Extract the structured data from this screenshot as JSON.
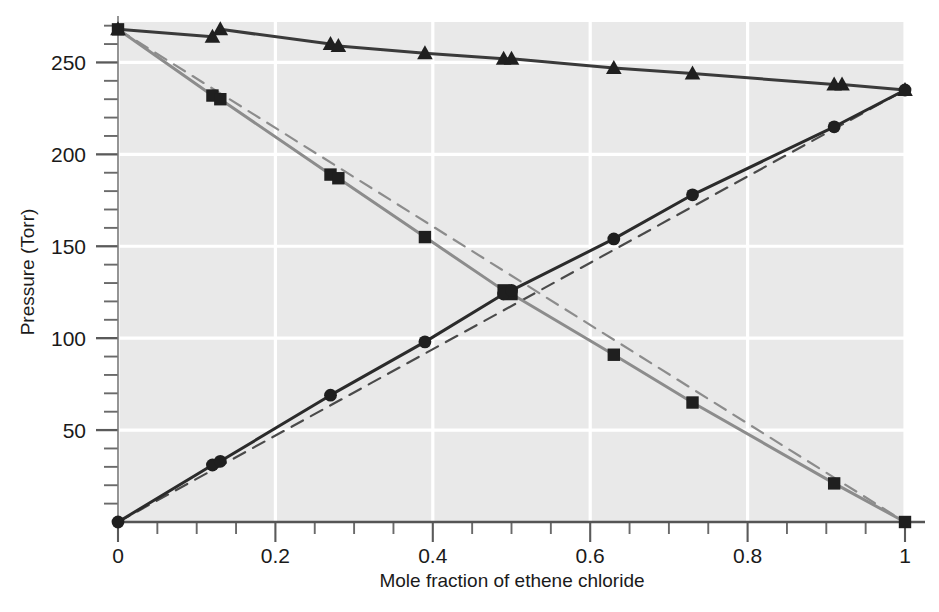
{
  "chart_data": {
    "type": "line",
    "title": "",
    "xlabel": "Mole fraction of ethene chloride",
    "ylabel": "Pressure (Torr)",
    "xlim": [
      0,
      1
    ],
    "ylim": [
      0,
      272
    ],
    "xticks": [
      "0",
      "0.2",
      "0.4",
      "0.6",
      "0.8",
      "1"
    ],
    "xtick_values": [
      0,
      0.2,
      0.4,
      0.6,
      0.8,
      1
    ],
    "yticks": [
      "50",
      "100",
      "150",
      "200",
      "250"
    ],
    "ytick_values": [
      50,
      100,
      150,
      200,
      250
    ],
    "x_minor_step": 0.05,
    "y_minor_step": 10,
    "grid": "white gridlines at major ticks",
    "plot_background": "#e9e9e9",
    "figure_background": "#ffffff",
    "legend": "none",
    "series": [
      {
        "name": "Total pressure",
        "marker": "triangle",
        "line_style": "solid",
        "color": "#3a3a3a",
        "x": [
          0,
          0.12,
          0.13,
          0.27,
          0.28,
          0.39,
          0.49,
          0.5,
          0.63,
          0.73,
          0.91,
          0.92,
          1
        ],
        "y": [
          268,
          264,
          268,
          260,
          259,
          255,
          252,
          252,
          247,
          244,
          238,
          238,
          235
        ]
      },
      {
        "name": "Partial pressure of benzene",
        "marker": "square",
        "line_style": "solid",
        "color": "#8c8c8c",
        "x": [
          0,
          0.12,
          0.13,
          0.27,
          0.28,
          0.39,
          0.49,
          0.5,
          0.63,
          0.73,
          0.91,
          1
        ],
        "y": [
          268,
          232,
          230,
          189,
          187,
          155,
          126,
          124,
          91,
          65,
          21,
          0
        ]
      },
      {
        "name": "Partial pressure of ethene chloride",
        "marker": "circle",
        "line_style": "solid",
        "color": "#2b2b2b",
        "x": [
          0,
          0.12,
          0.13,
          0.27,
          0.39,
          0.49,
          0.5,
          0.63,
          0.73,
          0.91,
          1
        ],
        "y": [
          0,
          31,
          33,
          69,
          98,
          124,
          126,
          154,
          178,
          215,
          235
        ]
      },
      {
        "name": "Raoult's law ideal line (ethene chloride)",
        "marker": "none",
        "line_style": "dashed",
        "color": "#4a4a4a",
        "x": [
          0,
          1
        ],
        "y": [
          0,
          235
        ]
      },
      {
        "name": "Raoult's law ideal line (benzene)",
        "marker": "none",
        "line_style": "dashed",
        "color": "#8c8c8c",
        "x": [
          0,
          1
        ],
        "y": [
          268,
          0
        ]
      }
    ]
  },
  "axes": {
    "x_title": "Mole fraction of ethene chloride",
    "y_title": "Pressure (Torr)"
  }
}
